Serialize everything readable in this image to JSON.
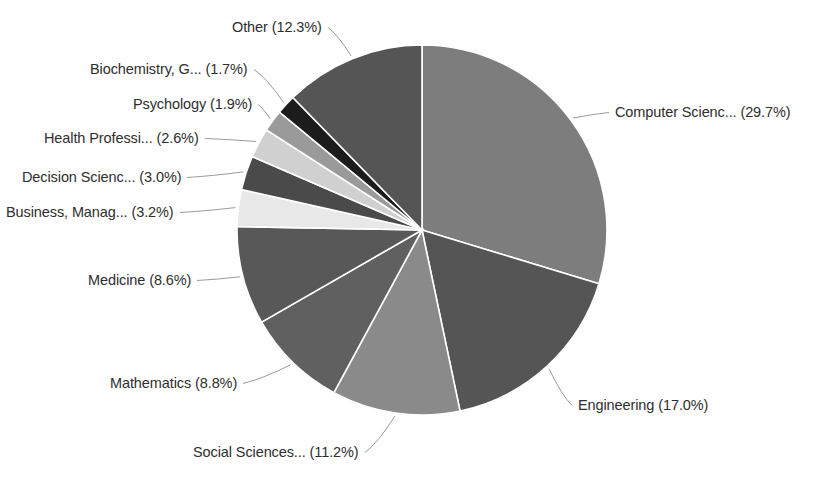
{
  "chart_data": {
    "type": "pie",
    "title": "",
    "subtitle": "",
    "xlabel": "",
    "ylabel": "",
    "grid": false,
    "legend_position": "none",
    "label_format": "{name} ({value}%)",
    "units": "percent",
    "total": 100.0,
    "start_angle_deg": 0,
    "direction": "clockwise",
    "geometry": {
      "center_x": 422,
      "center_y": 230,
      "radius": 185
    },
    "categories": [
      "Computer Scienc...",
      "Engineering",
      "Social Sciences...",
      "Mathematics",
      "Medicine",
      "Business, Manag...",
      "Decision Scienc...",
      "Health Professi...",
      "Psychology",
      "Biochemistry, G...",
      "Other"
    ],
    "values": [
      29.7,
      17.0,
      11.2,
      8.8,
      8.6,
      3.2,
      3.0,
      2.6,
      1.9,
      1.7,
      12.3
    ],
    "colors": [
      "#7d7d7d",
      "#555555",
      "#8a8a8a",
      "#606060",
      "#585858",
      "#e8e8e8",
      "#4a4a4a",
      "#d0d0d0",
      "#9a9a9a",
      "#1c1c1c",
      "#555555"
    ],
    "slice_border_color": "#ffffff",
    "slice_border_width": 1.6,
    "leader_line_color": "#9a9a9a",
    "label_text_color": "#2e2e2e",
    "background_color": "#ffffff",
    "slices": [
      {
        "name": "Computer Scienc...",
        "value": 29.7,
        "label": "Computer Scienc... (29.7%)",
        "color": "#7d7d7d",
        "side": "right"
      },
      {
        "name": "Engineering",
        "value": 17.0,
        "label": "Engineering (17.0%)",
        "color": "#555555",
        "side": "right"
      },
      {
        "name": "Social Sciences...",
        "value": 11.2,
        "label": "Social Sciences... (11.2%)",
        "color": "#8a8a8a",
        "side": "left"
      },
      {
        "name": "Mathematics",
        "value": 8.8,
        "label": "Mathematics (8.8%)",
        "color": "#606060",
        "side": "left"
      },
      {
        "name": "Medicine",
        "value": 8.6,
        "label": "Medicine (8.6%)",
        "color": "#585858",
        "side": "left"
      },
      {
        "name": "Business, Manag...",
        "value": 3.2,
        "label": "Business, Manag... (3.2%)",
        "color": "#e8e8e8",
        "side": "left"
      },
      {
        "name": "Decision Scienc...",
        "value": 3.0,
        "label": "Decision Scienc... (3.0%)",
        "color": "#4a4a4a",
        "side": "left"
      },
      {
        "name": "Health Professi...",
        "value": 2.6,
        "label": "Health Professi... (2.6%)",
        "color": "#d0d0d0",
        "side": "left"
      },
      {
        "name": "Psychology",
        "value": 1.9,
        "label": "Psychology (1.9%)",
        "color": "#9a9a9a",
        "side": "left"
      },
      {
        "name": "Biochemistry, G...",
        "value": 1.7,
        "label": "Biochemistry, G... (1.7%)",
        "color": "#1c1c1c",
        "side": "left"
      },
      {
        "name": "Other",
        "value": 12.3,
        "label": "Other (12.3%)",
        "color": "#555555",
        "side": "top"
      }
    ]
  },
  "labels": {
    "other": "Other (12.3%)",
    "biochemistry": "Biochemistry, G... (1.7%)",
    "psychology": "Psychology (1.9%)",
    "health_professions": "Health Professi... (2.6%)",
    "decision_sciences": "Decision Scienc... (3.0%)",
    "business_management": "Business, Manag... (3.2%)",
    "medicine": "Medicine (8.6%)",
    "mathematics": "Mathematics (8.8%)",
    "social_sciences": "Social Sciences... (11.2%)",
    "computer_science": "Computer Scienc... (29.7%)",
    "engineering": "Engineering (17.0%)"
  },
  "label_positions": {
    "other": {
      "x": 232,
      "y": 20,
      "side": "left"
    },
    "biochemistry": {
      "x": 90,
      "y": 62,
      "side": "left"
    },
    "psychology": {
      "x": 133,
      "y": 97,
      "side": "left"
    },
    "health_professions": {
      "x": 44,
      "y": 131,
      "side": "left"
    },
    "decision_sciences": {
      "x": 22,
      "y": 170,
      "side": "left"
    },
    "business_management": {
      "x": 6,
      "y": 205,
      "side": "left"
    },
    "medicine": {
      "x": 88,
      "y": 273,
      "side": "left"
    },
    "mathematics": {
      "x": 110,
      "y": 376,
      "side": "left"
    },
    "social_sciences": {
      "x": 193,
      "y": 445,
      "side": "left"
    },
    "computer_science": {
      "x": 615,
      "y": 105,
      "side": "right"
    },
    "engineering": {
      "x": 578,
      "y": 398,
      "side": "right"
    }
  }
}
